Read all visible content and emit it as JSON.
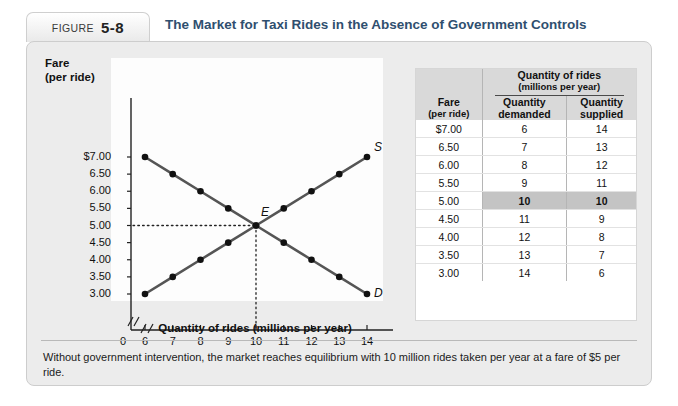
{
  "figure": {
    "tab_word": "FIGURE",
    "tab_number": "5-8",
    "title": "The Market for Taxi Rides in the Absence of Government Controls",
    "caption": "Without government intervention, the market reaches equilibrium with 10 million rides taken per year at a fare of $5 per ride."
  },
  "chart_data": {
    "type": "line",
    "title": "The Market for Taxi Rides in the Absence of Government Controls",
    "xlabel": "Quantity of rides (millions per year)",
    "ylabel": "Fare (per ride)",
    "ylabel_line1": "Fare",
    "ylabel_line2": "(per ride)",
    "xlim": [
      6,
      14
    ],
    "ylim": [
      3.0,
      7.0
    ],
    "x_ticks": [
      6,
      7,
      8,
      9,
      10,
      11,
      12,
      13,
      14
    ],
    "x_tick_labels": [
      "6",
      "7",
      "8",
      "9",
      "10",
      "11",
      "12",
      "13",
      "14"
    ],
    "origin_label": "0",
    "axis_break": "//",
    "y_ticks": [
      7.0,
      6.5,
      6.0,
      5.5,
      5.0,
      4.5,
      4.0,
      3.5,
      3.0
    ],
    "y_tick_labels": [
      "$7.00",
      "6.50",
      "6.00",
      "5.50",
      "5.00",
      "4.50",
      "4.00",
      "3.50",
      "3.00"
    ],
    "grid": false,
    "legend_position": "inline-curve-labels",
    "series": [
      {
        "name": "Demand",
        "label": "D",
        "color": "#555555",
        "x": [
          6,
          7,
          8,
          9,
          10,
          11,
          12,
          13,
          14
        ],
        "y": [
          7.0,
          6.5,
          6.0,
          5.5,
          5.0,
          4.5,
          4.0,
          3.5,
          3.0
        ]
      },
      {
        "name": "Supply",
        "label": "S",
        "color": "#555555",
        "x": [
          6,
          7,
          8,
          9,
          10,
          11,
          12,
          13,
          14
        ],
        "y": [
          3.0,
          3.5,
          4.0,
          4.5,
          5.0,
          5.5,
          6.0,
          6.5,
          7.0
        ]
      }
    ],
    "annotations": [
      {
        "label": "E",
        "x": 10,
        "y": 5.0,
        "note": "equilibrium point"
      }
    ]
  },
  "table": {
    "header": {
      "fare": "Fare",
      "fare_sub": "(per ride)",
      "group": "Quantity of rides",
      "group_sub": "(millions per year)",
      "demanded": "Quantity",
      "demanded_sub": "demanded",
      "supplied": "Quantity",
      "supplied_sub": "supplied"
    },
    "rows": [
      {
        "fare": "$7.00",
        "demanded": "6",
        "supplied": "14",
        "equilibrium": false
      },
      {
        "fare": "6.50",
        "demanded": "7",
        "supplied": "13",
        "equilibrium": false
      },
      {
        "fare": "6.00",
        "demanded": "8",
        "supplied": "12",
        "equilibrium": false
      },
      {
        "fare": "5.50",
        "demanded": "9",
        "supplied": "11",
        "equilibrium": false
      },
      {
        "fare": "5.00",
        "demanded": "10",
        "supplied": "10",
        "equilibrium": true
      },
      {
        "fare": "4.50",
        "demanded": "11",
        "supplied": "9",
        "equilibrium": false
      },
      {
        "fare": "4.00",
        "demanded": "12",
        "supplied": "8",
        "equilibrium": false
      },
      {
        "fare": "3.50",
        "demanded": "13",
        "supplied": "7",
        "equilibrium": false
      },
      {
        "fare": "3.00",
        "demanded": "14",
        "supplied": "6",
        "equilibrium": false
      }
    ]
  },
  "colors": {
    "title": "#2f4f6f",
    "panel": "#ececec",
    "curve": "#555555",
    "highlight": "#c4c4c4"
  }
}
